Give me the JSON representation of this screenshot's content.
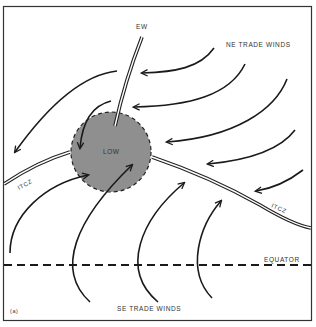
{
  "figure": {
    "panel_label": "(a)",
    "labels": {
      "easterly_wave": "EW",
      "ne_trade_winds": "NE TRADE WINDS",
      "se_trade_winds": "SE TRADE WINDS",
      "low": "LOW",
      "itcz_left": "ITCZ",
      "itcz_right": "ITCZ",
      "equator": "EQUATOR"
    },
    "colors": {
      "frame": "#333333",
      "arrow": "#1a1a1a",
      "low_fill": "#8f8f8f",
      "background": "#ffffff"
    }
  }
}
